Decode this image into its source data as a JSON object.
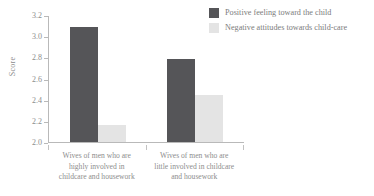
{
  "chart_data": {
    "type": "bar",
    "title": "",
    "xlabel": "",
    "ylabel": "Score",
    "ylim": [
      2.0,
      3.2
    ],
    "yticks": [
      "3.2",
      "3.0",
      "2.8",
      "2.6",
      "2.4",
      "2.2",
      "2.0"
    ],
    "grid": false,
    "legend_position": "top-right",
    "categories": [
      "Wives of men who are highly involved in childcare and housework",
      "Wives of men who are little involved in childcare and housework"
    ],
    "category_lines": [
      [
        "Wives of men who are",
        "highly involved in",
        "childcare and housework"
      ],
      [
        "Wives of men who are",
        "little involved in childcare",
        "and housework"
      ]
    ],
    "series": [
      {
        "name": "Positive feeling toward the child",
        "color": "#555558",
        "values": [
          3.1,
          2.79
        ]
      },
      {
        "name": "Negative attitudes towards child-care",
        "color": "#e4e4e4",
        "values": [
          2.16,
          2.45
        ]
      }
    ]
  },
  "axis": {
    "y_title": "Score"
  }
}
